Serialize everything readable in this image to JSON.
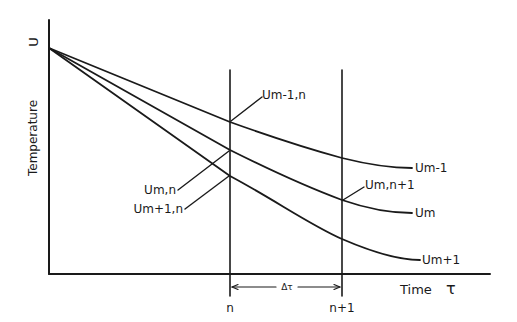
{
  "diagram": {
    "y_axis": {
      "symbol": "U",
      "label": "Temperature"
    },
    "x_axis": {
      "label": "Time",
      "symbol": "τ"
    },
    "time_steps": {
      "n": "n",
      "n_plus_1": "n+1",
      "interval": "Δτ"
    },
    "curves": [
      {
        "name": "Um-1",
        "label": "Um-1"
      },
      {
        "name": "Um",
        "label": "Um"
      },
      {
        "name": "Um+1",
        "label": "Um+1"
      }
    ],
    "point_labels": {
      "um_minus1_n": "Um-1,n",
      "um_n": "Um,n",
      "um_plus1_n": "Um+1,n",
      "um_n_plus1": "Um,n+1"
    }
  }
}
